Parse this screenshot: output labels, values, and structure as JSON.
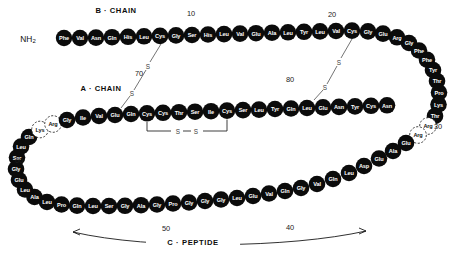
{
  "figure": {
    "type": "proinsulin-structure-diagram",
    "labels": {
      "b_chain_title": "B · CHAIN",
      "a_chain_title": "A · CHAIN",
      "c_peptide_title": "C · PEPTIDE",
      "n_terminus": "NH",
      "n_terminus_sub": "2"
    },
    "number_markers": [
      {
        "text": "10",
        "x": 191,
        "y": 13
      },
      {
        "text": "20",
        "x": 332,
        "y": 14
      },
      {
        "text": "30",
        "x": 438,
        "y": 126
      },
      {
        "text": "40",
        "x": 290,
        "y": 227
      },
      {
        "text": "50",
        "x": 166,
        "y": 228
      },
      {
        "text": "60",
        "x": 19,
        "y": 160
      },
      {
        "text": "70",
        "x": 139,
        "y": 73
      },
      {
        "text": "80",
        "x": 290,
        "y": 79
      }
    ],
    "disulfide_bonds": [
      {
        "name": "B7-A7",
        "s_top": "S",
        "s_bottom": "S"
      },
      {
        "name": "B19-A20",
        "s_top": "S",
        "s_bottom": "S"
      },
      {
        "name": "A6-A11",
        "s_left": "S",
        "s_right": "S"
      }
    ],
    "colors": {
      "residue_fill": "#0b0b0b",
      "residue_text": "#ffffff",
      "dotted_stroke": "#2b2b2b",
      "dotted_text": "#121212",
      "background": "#ffffff",
      "bond_line": "#5b5b5b"
    },
    "residues": [
      {
        "n": "Phe",
        "x": 64,
        "y": 38,
        "r": 8.2,
        "d": false
      },
      {
        "n": "Val",
        "x": 80,
        "y": 38,
        "r": 8.2,
        "d": false
      },
      {
        "n": "Asn",
        "x": 96,
        "y": 37.6,
        "r": 8.3,
        "d": false
      },
      {
        "n": "Gln",
        "x": 112,
        "y": 37.2,
        "r": 8.3,
        "d": false
      },
      {
        "n": "His",
        "x": 128,
        "y": 36.8,
        "r": 8.3,
        "d": false
      },
      {
        "n": "Leu",
        "x": 144,
        "y": 36.3,
        "r": 8.3,
        "d": false
      },
      {
        "n": "Cys",
        "x": 160,
        "y": 35.9,
        "r": 8.3,
        "d": false
      },
      {
        "n": "Gly",
        "x": 176,
        "y": 35.4,
        "r": 8.3,
        "d": false
      },
      {
        "n": "Ser",
        "x": 192,
        "y": 35,
        "r": 8.3,
        "d": false
      },
      {
        "n": "His",
        "x": 208,
        "y": 34.5,
        "r": 8.3,
        "d": false
      },
      {
        "n": "Leu",
        "x": 224,
        "y": 34.1,
        "r": 8.3,
        "d": false
      },
      {
        "n": "Val",
        "x": 240,
        "y": 33.6,
        "r": 8.3,
        "d": false
      },
      {
        "n": "Glu",
        "x": 256,
        "y": 33.2,
        "r": 8.3,
        "d": false
      },
      {
        "n": "Ala",
        "x": 272,
        "y": 32.7,
        "r": 8.3,
        "d": false
      },
      {
        "n": "Leu",
        "x": 288,
        "y": 32.3,
        "r": 8.3,
        "d": false
      },
      {
        "n": "Tyr",
        "x": 304,
        "y": 31.8,
        "r": 8.3,
        "d": false
      },
      {
        "n": "Leu",
        "x": 320,
        "y": 31.4,
        "r": 8.3,
        "d": false
      },
      {
        "n": "Val",
        "x": 336,
        "y": 31,
        "r": 8.3,
        "d": false
      },
      {
        "n": "Cys",
        "x": 352,
        "y": 30.6,
        "r": 8.3,
        "d": false
      },
      {
        "n": "Gly",
        "x": 368,
        "y": 31.4,
        "r": 8.3,
        "d": false
      },
      {
        "n": "Glu",
        "x": 383,
        "y": 33.6,
        "r": 8.3,
        "d": false
      },
      {
        "n": "Arg",
        "x": 397,
        "y": 37.3,
        "r": 8.3,
        "d": false
      },
      {
        "n": "Gly",
        "x": 409,
        "y": 43,
        "r": 8.3,
        "d": false
      },
      {
        "n": "Phe",
        "x": 419,
        "y": 50.5,
        "r": 8.3,
        "d": false
      },
      {
        "n": "Phe",
        "x": 427,
        "y": 59.7,
        "r": 8.3,
        "d": false
      },
      {
        "n": "Tyr",
        "x": 433,
        "y": 70,
        "r": 8.3,
        "d": false
      },
      {
        "n": "Thr",
        "x": 437,
        "y": 81,
        "r": 8.3,
        "d": false
      },
      {
        "n": "Pro",
        "x": 439,
        "y": 92.5,
        "r": 8.3,
        "d": false
      },
      {
        "n": "Lys",
        "x": 438.5,
        "y": 104.5,
        "r": 8.3,
        "d": false
      },
      {
        "n": "Thr",
        "x": 435,
        "y": 116,
        "r": 8.3,
        "d": false
      },
      {
        "n": "Arg",
        "x": 428,
        "y": 126,
        "r": 8.3,
        "d": true
      },
      {
        "n": "Arg",
        "x": 418,
        "y": 135,
        "r": 8.3,
        "d": true
      },
      {
        "n": "Glu",
        "x": 406,
        "y": 143,
        "r": 8.3,
        "d": false
      },
      {
        "n": "Ala",
        "x": 393,
        "y": 151,
        "r": 8.3,
        "d": false
      },
      {
        "n": "Glu",
        "x": 379,
        "y": 158.5,
        "r": 8.3,
        "d": false
      },
      {
        "n": "Asp",
        "x": 364,
        "y": 166,
        "r": 8.3,
        "d": false
      },
      {
        "n": "Leu",
        "x": 349,
        "y": 173,
        "r": 8.3,
        "d": false
      },
      {
        "n": "Gln",
        "x": 333,
        "y": 179,
        "r": 8.3,
        "d": false
      },
      {
        "n": "Val",
        "x": 317,
        "y": 184,
        "r": 8.3,
        "d": false
      },
      {
        "n": "Gly",
        "x": 301,
        "y": 188,
        "r": 8.3,
        "d": false
      },
      {
        "n": "Gln",
        "x": 285,
        "y": 191,
        "r": 8.3,
        "d": false
      },
      {
        "n": "Val",
        "x": 269,
        "y": 193.5,
        "r": 8.3,
        "d": false
      },
      {
        "n": "Glu",
        "x": 253,
        "y": 196,
        "r": 8.3,
        "d": false
      },
      {
        "n": "Leu",
        "x": 237,
        "y": 198,
        "r": 8.3,
        "d": false
      },
      {
        "n": "Gly",
        "x": 221,
        "y": 199.5,
        "r": 8.3,
        "d": false
      },
      {
        "n": "Gly",
        "x": 205,
        "y": 201,
        "r": 8.3,
        "d": false
      },
      {
        "n": "Gly",
        "x": 189,
        "y": 202.5,
        "r": 8.3,
        "d": false
      },
      {
        "n": "Pro",
        "x": 173,
        "y": 203.5,
        "r": 8.3,
        "d": false
      },
      {
        "n": "Gly",
        "x": 157,
        "y": 204.5,
        "r": 8.3,
        "d": false
      },
      {
        "n": "Ala",
        "x": 141,
        "y": 205.2,
        "r": 8.3,
        "d": false
      },
      {
        "n": "Gly",
        "x": 125,
        "y": 205.8,
        "r": 8.3,
        "d": false
      },
      {
        "n": "Ser",
        "x": 109,
        "y": 206,
        "r": 8.3,
        "d": false
      },
      {
        "n": "Leu",
        "x": 93,
        "y": 206,
        "r": 8.3,
        "d": false
      },
      {
        "n": "Gln",
        "x": 77,
        "y": 205.6,
        "r": 8.3,
        "d": false
      },
      {
        "n": "Pro",
        "x": 61.5,
        "y": 204.5,
        "r": 8.3,
        "d": false
      },
      {
        "n": "Leu",
        "x": 47,
        "y": 202,
        "r": 8.3,
        "d": false
      },
      {
        "n": "Ala",
        "x": 34.5,
        "y": 197,
        "r": 8.3,
        "d": false
      },
      {
        "n": "Leu",
        "x": 25,
        "y": 189.5,
        "r": 8.3,
        "d": false
      },
      {
        "n": "Glu",
        "x": 19,
        "y": 180,
        "r": 8.3,
        "d": false
      },
      {
        "n": "Gly",
        "x": 16,
        "y": 169,
        "r": 8.3,
        "d": false
      },
      {
        "n": "Ser",
        "x": 17,
        "y": 157.5,
        "r": 8.3,
        "d": false
      },
      {
        "n": "Leu",
        "x": 21,
        "y": 146.5,
        "r": 8.3,
        "d": false
      },
      {
        "n": "Gln",
        "x": 29,
        "y": 137,
        "r": 8.3,
        "d": false
      },
      {
        "n": "Lys",
        "x": 40,
        "y": 129.5,
        "r": 8.3,
        "d": true
      },
      {
        "n": "Arg",
        "x": 53,
        "y": 124,
        "r": 8.3,
        "d": true
      },
      {
        "n": "Gly",
        "x": 67,
        "y": 120,
        "r": 8.3,
        "d": false
      },
      {
        "n": "Ile",
        "x": 83,
        "y": 117.5,
        "r": 8.3,
        "d": false
      },
      {
        "n": "Val",
        "x": 99,
        "y": 116,
        "r": 8.3,
        "d": false
      },
      {
        "n": "Glu",
        "x": 115,
        "y": 115,
        "r": 8.3,
        "d": false
      },
      {
        "n": "Gln",
        "x": 131,
        "y": 114,
        "r": 8.3,
        "d": false
      },
      {
        "n": "Cys",
        "x": 147,
        "y": 113.3,
        "r": 8.3,
        "d": false
      },
      {
        "n": "Cys",
        "x": 163,
        "y": 112.8,
        "r": 8.3,
        "d": false
      },
      {
        "n": "Thr",
        "x": 179,
        "y": 112.2,
        "r": 8.3,
        "d": false
      },
      {
        "n": "Ser",
        "x": 195,
        "y": 111.7,
        "r": 8.3,
        "d": false
      },
      {
        "n": "Ile",
        "x": 211,
        "y": 111.2,
        "r": 8.3,
        "d": false
      },
      {
        "n": "Cys",
        "x": 227,
        "y": 110.6,
        "r": 8.3,
        "d": false
      },
      {
        "n": "Ser",
        "x": 243,
        "y": 110.1,
        "r": 8.3,
        "d": false
      },
      {
        "n": "Leu",
        "x": 259,
        "y": 109.6,
        "r": 8.3,
        "d": false
      },
      {
        "n": "Tyr",
        "x": 275,
        "y": 109,
        "r": 8.3,
        "d": false
      },
      {
        "n": "Gln",
        "x": 291,
        "y": 108.5,
        "r": 8.3,
        "d": false
      },
      {
        "n": "Leu",
        "x": 307,
        "y": 108,
        "r": 8.3,
        "d": false
      },
      {
        "n": "Glu",
        "x": 323,
        "y": 107.4,
        "r": 8.3,
        "d": false
      },
      {
        "n": "Asn",
        "x": 339,
        "y": 106.9,
        "r": 8.3,
        "d": false
      },
      {
        "n": "Tyr",
        "x": 355,
        "y": 106.4,
        "r": 8.3,
        "d": false
      },
      {
        "n": "Cys",
        "x": 371,
        "y": 105.8,
        "r": 8.3,
        "d": false
      },
      {
        "n": "Asn",
        "x": 387,
        "y": 105.3,
        "r": 8.3,
        "d": false
      }
    ]
  }
}
